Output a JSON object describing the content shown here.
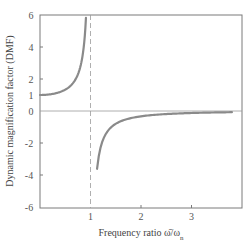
{
  "chart_data": {
    "type": "line",
    "title": "",
    "xlabel": "Frequency ratio ω̄/ωn",
    "xlabel_main": "Frequency ratio ω̄/ω",
    "xlabel_sub": "n",
    "ylabel": "Dynamic magnification factor (DMF)",
    "xlim": [
      0,
      4
    ],
    "ylim": [
      -6,
      6
    ],
    "x_ticks": [
      1,
      2,
      3
    ],
    "y_ticks": [
      6,
      4,
      2,
      1,
      0,
      -2,
      -4,
      -6
    ],
    "grid": false,
    "legend": null,
    "annotations": [
      "dashed vertical asymptote at x = 1",
      "horizontal reference line at y = 0"
    ],
    "series": [
      {
        "name": "DMF below resonance",
        "formula": "1/(1 - r^2)",
        "x": [
          0.0,
          0.2,
          0.4,
          0.5,
          0.6,
          0.7,
          0.8,
          0.85,
          0.9,
          0.91
        ],
        "y": [
          1.0,
          1.04,
          1.19,
          1.33,
          1.56,
          1.96,
          2.78,
          3.6,
          5.26,
          5.5
        ]
      },
      {
        "name": "DMF above resonance",
        "formula": "1/(1 - r^2)",
        "x": [
          1.13,
          1.2,
          1.4,
          1.6,
          2.0,
          2.5,
          3.0,
          3.5,
          3.8
        ],
        "y": [
          -3.7,
          -2.27,
          -1.04,
          -0.64,
          -0.33,
          -0.19,
          -0.125,
          -0.089,
          -0.074
        ]
      }
    ],
    "colors": {
      "curve": "#8a8a8a",
      "frame": "#7a7a7a",
      "asymptote": "#9a9a9a",
      "text": "#555555"
    }
  }
}
